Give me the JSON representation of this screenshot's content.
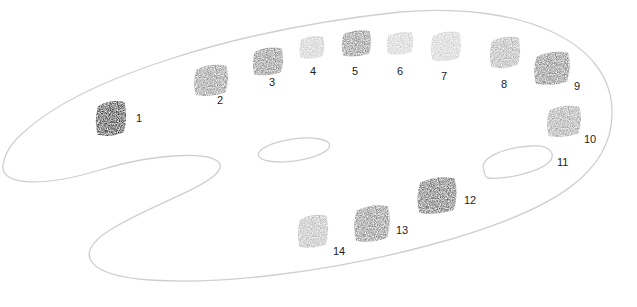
{
  "figure": {
    "outline_color": "#c8c8c8"
  },
  "swatches": [
    {
      "number": "1",
      "shade": "#151515",
      "x": 94,
      "y": 98,
      "w": 34,
      "h": 40,
      "label_x": 136,
      "label_y": 113
    },
    {
      "number": "2",
      "shade": "#7a7a7a",
      "x": 192,
      "y": 62,
      "w": 38,
      "h": 36,
      "label_x": 217,
      "label_y": 95
    },
    {
      "number": "3",
      "shade": "#6e6e6e",
      "x": 251,
      "y": 45,
      "w": 34,
      "h": 32,
      "label_x": 269,
      "label_y": 77
    },
    {
      "number": "4",
      "shade": "#bdbdbd",
      "x": 298,
      "y": 34,
      "w": 28,
      "h": 26,
      "label_x": 310,
      "label_y": 66
    },
    {
      "number": "5",
      "shade": "#727272",
      "x": 340,
      "y": 28,
      "w": 33,
      "h": 30,
      "label_x": 352,
      "label_y": 66
    },
    {
      "number": "6",
      "shade": "#c4c4c4",
      "x": 385,
      "y": 30,
      "w": 30,
      "h": 26,
      "label_x": 397,
      "label_y": 66
    },
    {
      "number": "7",
      "shade": "#c2c2c2",
      "x": 429,
      "y": 29,
      "w": 34,
      "h": 34,
      "label_x": 441,
      "label_y": 71
    },
    {
      "number": "8",
      "shade": "#9c9c9c",
      "x": 488,
      "y": 34,
      "w": 34,
      "h": 36,
      "label_x": 501,
      "label_y": 79
    },
    {
      "number": "9",
      "shade": "#6a6a6a",
      "x": 532,
      "y": 49,
      "w": 40,
      "h": 38,
      "label_x": 574,
      "label_y": 81
    },
    {
      "number": "10",
      "shade": "#8e8e8e",
      "x": 545,
      "y": 103,
      "w": 38,
      "h": 36,
      "label_x": 584,
      "label_y": 134
    },
    {
      "number": "12",
      "shade": "#4a4a4a",
      "x": 415,
      "y": 174,
      "w": 44,
      "h": 42,
      "label_x": 464,
      "label_y": 195
    },
    {
      "number": "13",
      "shade": "#6e6e6e",
      "x": 352,
      "y": 202,
      "w": 40,
      "h": 42,
      "label_x": 396,
      "label_y": 225
    },
    {
      "number": "14",
      "shade": "#a8a8a8",
      "x": 296,
      "y": 212,
      "w": 34,
      "h": 38,
      "label_x": 333,
      "label_y": 246
    }
  ],
  "thumb_hole": {
    "number": "11",
    "label_x": 557,
    "label_y": 157
  }
}
